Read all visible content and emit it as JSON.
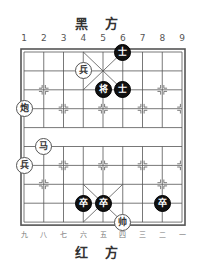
{
  "board": {
    "top_side_label": "黑 方",
    "bottom_side_label": "红 方",
    "top_file_labels": [
      "1",
      "2",
      "3",
      "4",
      "5",
      "6",
      "7",
      "8",
      "9"
    ],
    "bottom_file_labels": [
      "九",
      "八",
      "七",
      "六",
      "五",
      "四",
      "三",
      "二",
      "一"
    ],
    "files": 9,
    "ranks": 10,
    "colors": {
      "line": "#555555",
      "black_piece": "#111111",
      "red_piece_fill": "#ffffff"
    }
  },
  "pieces": [
    {
      "side": "black",
      "char": "士",
      "file": 6,
      "rank": 0
    },
    {
      "side": "red",
      "char": "兵",
      "file": 4,
      "rank": 1
    },
    {
      "side": "black",
      "char": "将",
      "file": 5,
      "rank": 2
    },
    {
      "side": "black",
      "char": "士",
      "file": 6,
      "rank": 2
    },
    {
      "side": "red",
      "char": "炮",
      "file": 1,
      "rank": 3
    },
    {
      "side": "red",
      "char": "马",
      "file": 2,
      "rank": 5
    },
    {
      "side": "red",
      "char": "兵",
      "file": 1,
      "rank": 6
    },
    {
      "side": "black",
      "char": "卒",
      "file": 4,
      "rank": 8
    },
    {
      "side": "black",
      "char": "卒",
      "file": 5,
      "rank": 8
    },
    {
      "side": "black",
      "char": "卒",
      "file": 8,
      "rank": 8
    },
    {
      "side": "red",
      "char": "帅",
      "file": 6,
      "rank": 9
    }
  ]
}
